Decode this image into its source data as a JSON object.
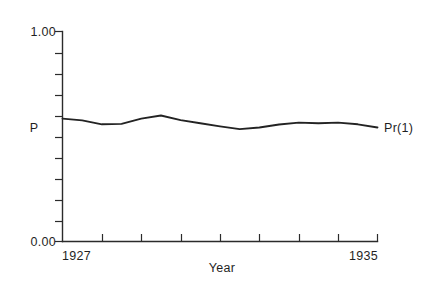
{
  "chart_data": {
    "type": "line",
    "title": "",
    "xlabel": "Year",
    "ylabel": "P",
    "xlim": [
      1927,
      1935
    ],
    "ylim": [
      0.0,
      1.0
    ],
    "grid": false,
    "legend_position": "inline-right-end",
    "y_tick_labels": [
      "0.00",
      "1.00"
    ],
    "y_tick_values": [
      0.0,
      1.0
    ],
    "y_minor_ticks": [
      0.1,
      0.2,
      0.3,
      0.4,
      0.5,
      0.6,
      0.7,
      0.8,
      0.9
    ],
    "x_tick_labels": [
      "1927",
      "1935"
    ],
    "x_tick_values": [
      1927,
      1935
    ],
    "x_minor_ticks": [
      1928,
      1929,
      1930,
      1931,
      1932,
      1933,
      1934
    ],
    "series": [
      {
        "name": "Pr(1)",
        "annotation": "Pr(1)",
        "x": [
          1927.0,
          1927.5,
          1928.0,
          1928.5,
          1929.0,
          1929.5,
          1930.0,
          1930.5,
          1931.0,
          1931.5,
          1932.0,
          1932.5,
          1933.0,
          1933.5,
          1934.0,
          1934.5,
          1935.0
        ],
        "values": [
          0.585,
          0.577,
          0.558,
          0.56,
          0.585,
          0.6,
          0.578,
          0.563,
          0.548,
          0.535,
          0.543,
          0.557,
          0.566,
          0.563,
          0.566,
          0.558,
          0.543
        ]
      }
    ],
    "line_color": "#232323",
    "axis_color": "#2b2b2b",
    "background_color": "#ffffff"
  },
  "labels": {
    "y_axis_caption": "P",
    "x_axis_caption": "Year",
    "y_max": "1.00",
    "y_min": "0.00",
    "x_min": "1927",
    "x_max": "1935",
    "series_annotation": "Pr(1)"
  }
}
